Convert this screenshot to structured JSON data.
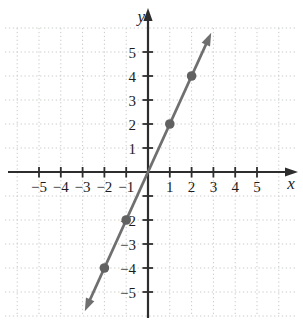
{
  "figure": {
    "background": "#ffffff",
    "width": 303,
    "height": 324
  },
  "chart_data": {
    "type": "line",
    "title": "",
    "xlabel": "x",
    "ylabel": "y",
    "xlim": [
      -6,
      6
    ],
    "ylim": [
      -6,
      6
    ],
    "grid": "dotted",
    "legend": "none",
    "x_ticks": [
      -5,
      -4,
      -3,
      -2,
      -1,
      1,
      2,
      3,
      4,
      5
    ],
    "y_ticks": [
      -5,
      -4,
      -3,
      -2,
      -1,
      1,
      2,
      3,
      4,
      5
    ],
    "x_tick_labels": [
      [
        -5,
        "−5"
      ],
      [
        -4,
        "−4"
      ],
      [
        -3,
        "−3"
      ],
      [
        -2,
        "−2"
      ],
      [
        -1,
        "−1"
      ],
      [
        1,
        "1"
      ],
      [
        2,
        "2"
      ],
      [
        3,
        "3"
      ],
      [
        4,
        "4"
      ],
      [
        5,
        "5"
      ]
    ],
    "y_tick_labels": [
      [
        1,
        "1"
      ],
      [
        2,
        "2"
      ],
      [
        3,
        "3"
      ],
      [
        4,
        "4"
      ],
      [
        5,
        "5"
      ],
      [
        -2,
        "−2"
      ],
      [
        -3,
        "−3"
      ],
      [
        -4,
        "−4"
      ],
      [
        -5,
        "−5"
      ]
    ],
    "series": [
      {
        "name": "line-y-equals-2x",
        "slope": 2,
        "intercept": 0,
        "draw_range_x": [
          -2.9,
          2.9
        ],
        "arrows_both_ends": true,
        "marked_points": [
          [
            -2,
            -4
          ],
          [
            -1,
            -2
          ],
          [
            1,
            2
          ],
          [
            2,
            4
          ]
        ]
      }
    ],
    "colors": {
      "axis": "#2d2d2d",
      "grid": "#c7ccc7",
      "line": "#6f6f6f",
      "point": "#616161",
      "label": "#1c1c1c"
    }
  }
}
